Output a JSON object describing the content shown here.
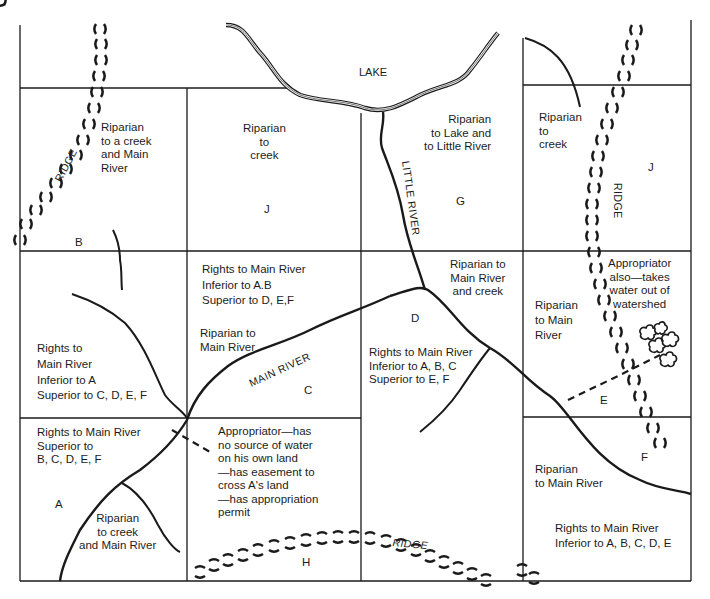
{
  "diagram": {
    "title_labels": {
      "lake": "LAKE",
      "little_river": "LITTLE RIVER",
      "main_river": "MAIN RIVER",
      "ridge_left": "RIDGE",
      "ridge_right": "RIDGE",
      "ridge_bottom": "RIDGE"
    },
    "parcels": [
      {
        "id": "A",
        "letter": "A",
        "text": "Rights to Main River\nSuperior to\nB, C, D, E, F",
        "subtext": "Riparian\nto creek\nand Main River"
      },
      {
        "id": "B",
        "letter": "B",
        "text": "Riparian\nto a creek\nand Main\nRiver",
        "subtext": "Rights to\nMain River\nInferior to A\nSuperior to C, D, E, F"
      },
      {
        "id": "C",
        "letter": "C",
        "text": "Rights to Main River\nInferior to A.B\nSuperior to D, E,F",
        "subtext": "Riparian to\nMain River"
      },
      {
        "id": "D",
        "letter": "D",
        "text": "Riparian to\nMain River\nand creek",
        "subtext": "Rights to Main River\nInferior to A, B, C\nSuperior to E, F"
      },
      {
        "id": "E",
        "letter": "E",
        "text": "Riparian\nto Main\nRiver",
        "subtext": "Appropriator\nalso—takes\nwater out of\nwatershed"
      },
      {
        "id": "F",
        "letter": "F",
        "text": "Riparian\nto Main River",
        "subtext": "Rights to Main River\nInferior to A, B, C, D, E"
      },
      {
        "id": "G",
        "letter": "G",
        "text": "Riparian\nto Lake and\nto Little River"
      },
      {
        "id": "H",
        "letter": "H",
        "text": "Appropriator—has\nno source of water\non his own land\n—has easement to\ncross A's land\n—has appropriation\npermit"
      },
      {
        "id": "I",
        "letter": "I",
        "text": "Riparian to\nLake"
      },
      {
        "id": "J",
        "letter": "J",
        "text": "Riparian\nto\ncreek"
      }
    ]
  }
}
